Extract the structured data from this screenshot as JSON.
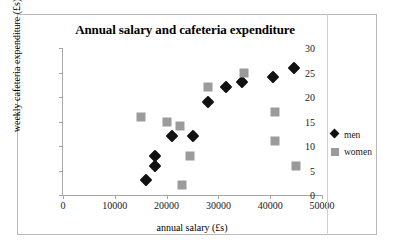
{
  "chart_data": {
    "type": "scatter",
    "title": "Annual salary and cafeteria expenditure",
    "xlabel": "annual salary (£s)",
    "ylabel": "weekly cafeteria expenditure (£s)",
    "xlim": [
      0,
      50000
    ],
    "ylim": [
      0,
      30
    ],
    "xticks": [
      0,
      10000,
      20000,
      30000,
      40000,
      50000
    ],
    "xtick_labels": [
      "0",
      "10000",
      "20000",
      "30000",
      "40000",
      "50000"
    ],
    "yticks": [
      0,
      5,
      10,
      15,
      20,
      25,
      30
    ],
    "ytick_labels": [
      "0",
      "5",
      "10",
      "15",
      "20",
      "25",
      "30"
    ],
    "grid": false,
    "legend_position": "right",
    "series": [
      {
        "name": "men",
        "marker": "diamond",
        "color": "#111111",
        "points": [
          [
            16000,
            3
          ],
          [
            17800,
            6
          ],
          [
            17800,
            8
          ],
          [
            21000,
            12
          ],
          [
            25000,
            12
          ],
          [
            28000,
            19
          ],
          [
            31500,
            22
          ],
          [
            34500,
            23
          ],
          [
            40500,
            24
          ],
          [
            44500,
            26
          ]
        ]
      },
      {
        "name": "women",
        "marker": "square",
        "color": "#9b9b9b",
        "points": [
          [
            15000,
            16
          ],
          [
            20000,
            15
          ],
          [
            22500,
            14
          ],
          [
            23000,
            2
          ],
          [
            24500,
            8
          ],
          [
            28000,
            22
          ],
          [
            35000,
            25
          ],
          [
            41000,
            17
          ],
          [
            41000,
            11
          ],
          [
            45000,
            6
          ]
        ]
      }
    ]
  },
  "legend": {
    "entries": [
      {
        "label": "men"
      },
      {
        "label": "women"
      }
    ]
  }
}
